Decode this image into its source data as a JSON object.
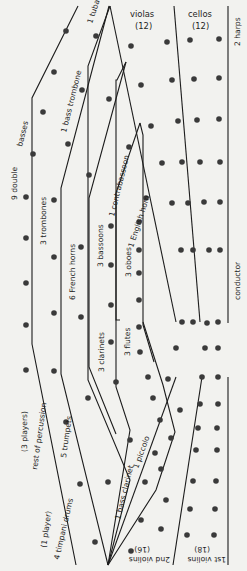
{
  "diagram": {
    "sections": {
      "violas": {
        "label": "violas",
        "count": "(12)"
      },
      "cellos": {
        "label": "cellos",
        "count": "(12)"
      },
      "harps": {
        "label": "2 harps"
      },
      "conductor": {
        "label": "conductor"
      },
      "first_violins": {
        "label": "1st violins",
        "count": "(18)"
      },
      "second_violins": {
        "label": "2nd violins",
        "count": "(16)"
      },
      "tuba": {
        "label": "1 tuba"
      },
      "bass_trombone": {
        "label": "1 bass trombone"
      },
      "double_basses": {
        "label": "9 double",
        "label2": "basses"
      },
      "trombones": {
        "label": "3 trombones"
      },
      "french_horns": {
        "label": "6 French horns"
      },
      "contrabassoon": {
        "label": "1 contrabassoon"
      },
      "bassoons": {
        "label": "3 bassoons"
      },
      "english_horn": {
        "label": "1 English horn"
      },
      "oboes": {
        "label": "3 oboes"
      },
      "clarinets": {
        "label": "3  clarinets"
      },
      "flutes": {
        "label": "3 flutes"
      },
      "piccolo": {
        "label": "1 piccolo"
      },
      "bass_clarinet": {
        "label": "1 bass clarinet"
      },
      "percussion_players": {
        "label": "(3 players)"
      },
      "percussion": {
        "label": "rest of percussion"
      },
      "trumpets": {
        "label": "5 trumpets"
      },
      "timpani_players": {
        "label": "(1 player)"
      },
      "timpani": {
        "label": "4 timpani drums"
      }
    },
    "colors": {
      "background": "#f2f2ef",
      "ink": "#1c1c1c",
      "dot": "#3a3a3a"
    }
  }
}
